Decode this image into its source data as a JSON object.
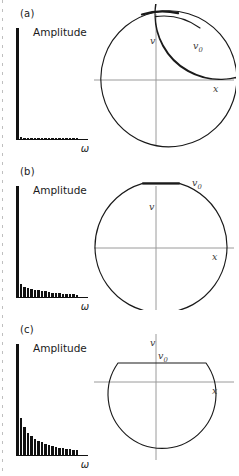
{
  "figure": {
    "page_edge_icon": "dashed-page-crop-line"
  },
  "axis_labels": {
    "amplitude": "Amplitude",
    "omega": "ω",
    "velocity": "v",
    "position": "x",
    "v_initial": "v",
    "v_initial_sub": "0"
  },
  "panels": [
    {
      "id": "a",
      "letter": "(a)",
      "spectrum_name": "harmonic-spectrum-a",
      "phase_name": "phase-portrait-a",
      "phase_type": "spiral",
      "turns": 3,
      "flat_top": false
    },
    {
      "id": "b",
      "letter": "(b)",
      "spectrum_name": "harmonic-spectrum-b",
      "phase_name": "phase-portrait-b",
      "phase_type": "circle-flat-top",
      "turns": 1,
      "flat_top": true
    },
    {
      "id": "c",
      "letter": "(c)",
      "spectrum_name": "harmonic-spectrum-c",
      "phase_name": "phase-portrait-c",
      "phase_type": "clipped-dome",
      "turns": 1,
      "flat_top": true
    }
  ],
  "chart_data": [
    {
      "type": "bar",
      "panel": "a",
      "title": "Amplitude",
      "xlabel": "ω",
      "ylabel": "Amplitude",
      "categories": [
        1,
        2,
        3,
        4,
        5,
        6,
        7,
        8,
        9,
        10,
        11,
        12,
        13,
        14,
        15,
        16,
        17,
        18
      ],
      "values": [
        100,
        1.5,
        1.2,
        1.0,
        0.9,
        0.8,
        0.8,
        0.7,
        0.7,
        0.6,
        0.6,
        0.6,
        0.5,
        0.5,
        0.5,
        0.4,
        0.4,
        0.4
      ],
      "ylim": [
        0,
        100
      ],
      "grid": false,
      "legend": false
    },
    {
      "type": "bar",
      "panel": "b",
      "title": "Amplitude",
      "xlabel": "ω",
      "ylabel": "Amplitude",
      "categories": [
        1,
        2,
        3,
        4,
        5,
        6,
        7,
        8,
        9,
        10,
        11,
        12,
        13,
        14,
        15,
        16,
        17,
        18
      ],
      "values": [
        100,
        12,
        9,
        8,
        7,
        6.5,
        6,
        5.5,
        5,
        4.5,
        4,
        3.5,
        3.2,
        3,
        2.8,
        2.5,
        2.3,
        2.1
      ],
      "ylim": [
        0,
        100
      ],
      "grid": false,
      "legend": false
    },
    {
      "type": "bar",
      "panel": "c",
      "title": "Amplitude",
      "xlabel": "ω",
      "ylabel": "Amplitude",
      "categories": [
        1,
        2,
        3,
        4,
        5,
        6,
        7,
        8,
        9,
        10,
        11,
        12,
        13,
        14,
        15,
        16,
        17,
        18
      ],
      "values": [
        100,
        33,
        25,
        20,
        17,
        14.5,
        13,
        11.5,
        10,
        9,
        8,
        7.2,
        6.5,
        6,
        5.5,
        5,
        4.6,
        4.2
      ],
      "ylim": [
        0,
        100
      ],
      "grid": false,
      "legend": false
    }
  ]
}
